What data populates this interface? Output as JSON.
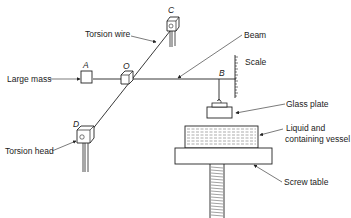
{
  "diagram": {
    "type": "torsion-balance-apparatus",
    "point_labels": {
      "A": "A",
      "B": "B",
      "C": "C",
      "D": "D",
      "O": "O"
    },
    "callouts": {
      "torsion_wire": "Torsion wire",
      "beam": "Beam",
      "large_mass": "Large mass",
      "scale": "Scale",
      "glass_plate": "Glass plate",
      "liquid_line1": "Liquid  and",
      "liquid_line2": "containing vessel",
      "torsion_head": "Torsion head",
      "screw_table": "Screw table"
    },
    "colors": {
      "line": "#222222",
      "background": "#ffffff"
    }
  }
}
